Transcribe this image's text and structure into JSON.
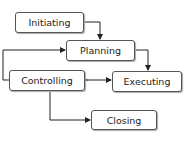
{
  "diagram": {
    "nodes": [
      {
        "id": "initiating",
        "label": "Initiating"
      },
      {
        "id": "planning",
        "label": "Planning"
      },
      {
        "id": "controlling",
        "label": "Controlling"
      },
      {
        "id": "executing",
        "label": "Executing"
      },
      {
        "id": "closing",
        "label": "Closing"
      }
    ],
    "edges": [
      {
        "from": "initiating",
        "to": "planning"
      },
      {
        "from": "planning",
        "to": "executing"
      },
      {
        "from": "controlling",
        "to": "planning"
      },
      {
        "from": "controlling",
        "to": "executing",
        "bidirectional": true
      },
      {
        "from": "controlling",
        "to": "closing"
      }
    ]
  }
}
